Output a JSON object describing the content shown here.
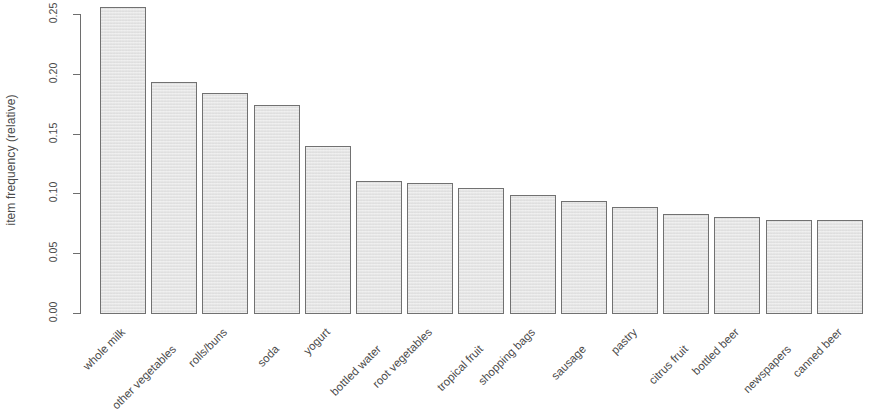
{
  "chart_data": {
    "type": "bar",
    "title": "",
    "subtitle": "",
    "xlabel": "",
    "ylabel": "item frequency (relative)",
    "ylim": [
      0.0,
      0.26
    ],
    "ytick_labels": [
      "0.00",
      "0.05",
      "0.10",
      "0.15",
      "0.20",
      "0.25"
    ],
    "ytick_values": [
      0.0,
      0.05,
      0.1,
      0.15,
      0.2,
      0.25
    ],
    "grid": false,
    "legend": null,
    "categories": [
      "whole milk",
      "other vegetables",
      "rolls/buns",
      "soda",
      "yogurt",
      "bottled water",
      "root vegetables",
      "tropical fruit",
      "shopping bags",
      "sausage",
      "pastry",
      "citrus fruit",
      "bottled beer",
      "newspapers",
      "canned beer"
    ],
    "values": [
      0.2555,
      0.1935,
      0.1839,
      0.1743,
      0.1395,
      0.1105,
      0.109,
      0.1049,
      0.0985,
      0.094,
      0.0889,
      0.0828,
      0.0805,
      0.078,
      0.0777
    ],
    "bar_fill_color": "#e9e9e9",
    "bar_border_color": "#717171",
    "axis_color": "#6e6e6e"
  }
}
